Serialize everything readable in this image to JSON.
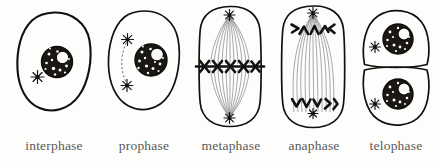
{
  "figure": {
    "style": "hand-drawn ink illustration",
    "background_color": "#fdfdfc",
    "ink_color": "#13110f",
    "label_color": "#5a5a58"
  },
  "phases": [
    {
      "id": "interphase",
      "label": "interphase",
      "order": 1,
      "cell_shape": "round",
      "nucleus_count": 1,
      "centrosome_count": 1,
      "spindle_visible": false,
      "chromosomes_condensed": false,
      "description": "Single round cell with one intact dark nucleus and a single centrosome star at lower left"
    },
    {
      "id": "prophase",
      "label": "prophase",
      "order": 2,
      "cell_shape": "oval",
      "nucleus_count": 1,
      "centrosome_count": 2,
      "spindle_visible": true,
      "chromosomes_condensed": true,
      "description": "Oval cell, nucleus to the right, two centrosome stars at left joined by a faint spindle arc"
    },
    {
      "id": "metaphase",
      "label": "metaphase",
      "order": 3,
      "cell_shape": "rounded-rectangle",
      "nucleus_count": 0,
      "centrosome_count": 2,
      "spindle_visible": true,
      "chromosomes_condensed": true,
      "chromosome_arrangement": "aligned at equatorial plate",
      "chromosome_count": 5,
      "description": "Elongated cell with spindle fibers from top and bottom poles and dark X-shaped chromosomes in a row at the equator"
    },
    {
      "id": "anaphase",
      "label": "anaphase",
      "order": 4,
      "cell_shape": "rounded-rectangle",
      "nucleus_count": 0,
      "centrosome_count": 2,
      "spindle_visible": true,
      "chromosomes_condensed": true,
      "chromosome_arrangement": "separating toward opposite poles",
      "chromosome_count_per_pole": 5,
      "description": "Elongated cell with V-shaped chromosomes pulled toward each pole along long spindle fibers"
    },
    {
      "id": "telophase",
      "label": "telophase",
      "order": 5,
      "cell_shape": "two-daughter-cells",
      "nucleus_count": 2,
      "centrosome_count": 2,
      "spindle_visible": false,
      "chromosomes_condensed": false,
      "description": "Two daughter cells stacked vertically, each with a reformed nucleus and a centrosome star at left"
    }
  ]
}
